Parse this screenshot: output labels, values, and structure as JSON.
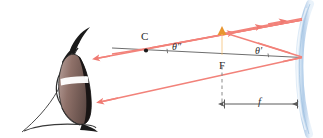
{
  "figure": {
    "kind": "optics-ray-diagram",
    "background_color": "#ffffff",
    "width": 323,
    "height": 138
  },
  "labels": {
    "center_of_curvature": "C",
    "focal_point": "F",
    "angle_left": "θ″",
    "angle_right": "θ′",
    "focal_length": "f"
  },
  "colors": {
    "ray": "#f4877f",
    "ray_dark": "#e8655c",
    "mirror": "#bcd4ec",
    "mirror_edge": "#8fb4d8",
    "axis": "#6b6b6b",
    "arrow_object": "#f0a33c",
    "arrow_object_edge": "#d9862a",
    "eye_outline": "#2a2a2a",
    "iris": "#8a6f6a",
    "pupil": "#1c1414",
    "dashed": "#808080",
    "text": "#2b2b2b"
  },
  "elements": {
    "mirror_label": "concave-mirror",
    "axis_label": "principal-axis",
    "object_arrow_label": "object-arrow-at-focal-point",
    "eye_label": "observer-eye",
    "focal_dimension_label": "focal-length-dimension",
    "dashed_line_label": "focal-point-dashed-drop-line",
    "ray_count": 4
  },
  "geometry": {
    "mirror_vertex_x": 302,
    "mirror_vertex_y": 57,
    "focal_point_x": 222,
    "focal_point_y": 57,
    "center_point_x": 146,
    "center_point_y": 52
  }
}
